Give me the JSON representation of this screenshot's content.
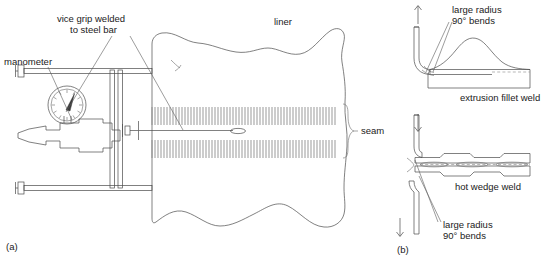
{
  "figure": {
    "panel_a": {
      "caption": "(a)",
      "labels": {
        "vice_grip": "vice grip welded\nto steel bar",
        "vice_grip_line1": "vice grip welded",
        "vice_grip_line2": "to steel bar",
        "manometer": "manometer",
        "liner": "liner",
        "seam": "seam"
      }
    },
    "panel_b": {
      "caption": "(b)",
      "labels": {
        "large_radius_top_line1": "large radius",
        "large_radius_top_line2": "90° bends",
        "extrusion_fillet_weld": "extrusion fillet weld",
        "hot_wedge_weld": "hot wedge weld",
        "large_radius_bottom_line1": "large radius",
        "large_radius_bottom_line2": "90° bends"
      }
    },
    "colors": {
      "line": "#4a4a4a",
      "hatch": "#888888",
      "text": "#1a1a1a",
      "background": "#ffffff"
    }
  }
}
